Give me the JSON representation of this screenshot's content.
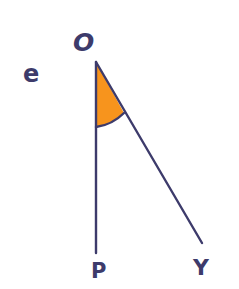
{
  "diagram": {
    "labels": {
      "vertex": "O",
      "side_label": "e",
      "ray_end_1": "P",
      "ray_end_2": "Y"
    },
    "geometry": {
      "vertex": [
        96,
        62
      ],
      "ray_op_end": [
        96,
        253
      ],
      "ray_oy_end": [
        202,
        243
      ],
      "arc_start": [
        96,
        127
      ],
      "arc_end": [
        124,
        113
      ]
    },
    "colors": {
      "stroke": "#3d3b6b",
      "angle_fill": "#f7941d",
      "background": "#ffffff"
    }
  }
}
